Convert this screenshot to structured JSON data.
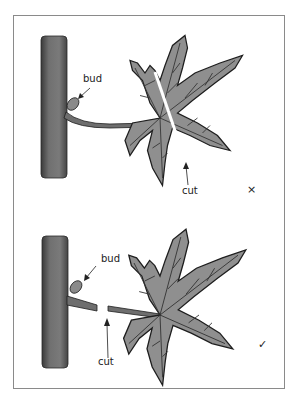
{
  "figure": {
    "panels": [
      {
        "id": "incorrect",
        "bud_label": "bud",
        "cut_label": "cut",
        "verdict_mark": "×",
        "verdict": "incorrect"
      },
      {
        "id": "correct",
        "bud_label": "bud",
        "cut_label": "cut",
        "verdict_mark": "✓",
        "verdict": "correct"
      }
    ],
    "colors": {
      "stem": "#6e6e6e",
      "leaf": "#8f8f8f",
      "outline": "#1e1e1e",
      "frame": "#8a8a8a",
      "background": "#ffffff"
    }
  }
}
